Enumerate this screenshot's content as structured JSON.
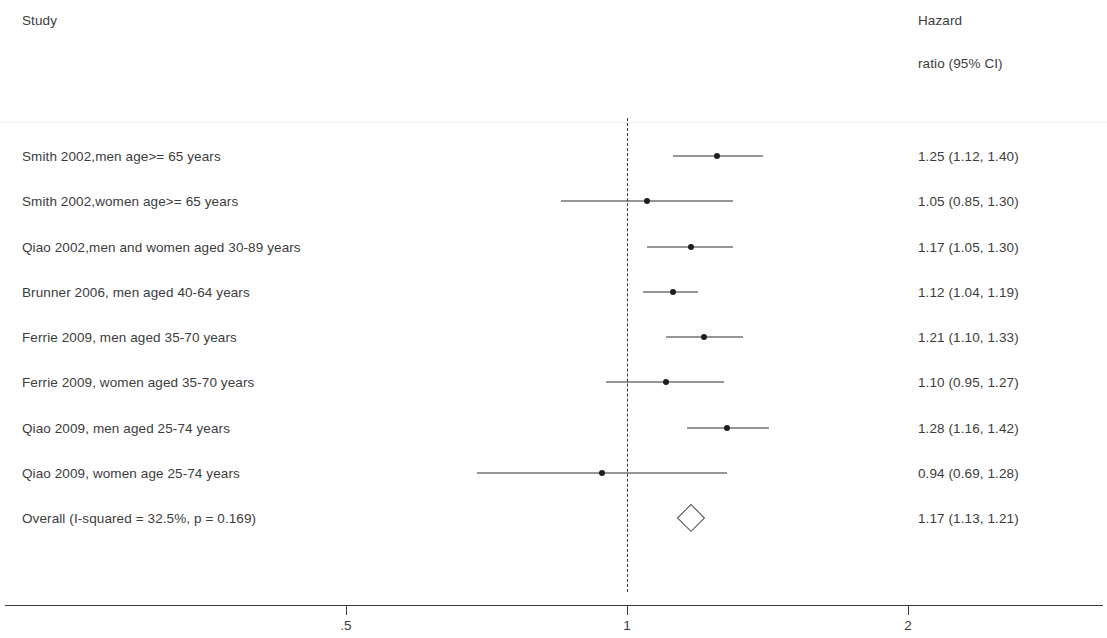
{
  "header": {
    "study_label": "Study",
    "effect_label_line1": "Hazard",
    "effect_label_line2": "ratio (95% CI)"
  },
  "chart_data": {
    "type": "forest",
    "title": "",
    "xlabel": "",
    "ylabel": "",
    "scale": "log",
    "null_value": 1,
    "xticks": [
      ".5",
      "1",
      "2"
    ],
    "xtick_values": [
      0.5,
      1,
      2
    ],
    "xlim": [
      0.5,
      2
    ],
    "grid": false,
    "legend": "none",
    "effect_measure": "Hazard ratio (95% CI)",
    "heterogeneity": "I-squared = 32.5%, p = 0.169",
    "categories": [
      "Smith 2002,men age>= 65 years",
      "Smith 2002,women age>= 65 years",
      "Qiao 2002,men and women aged 30-89 years",
      "Brunner 2006, men aged 40-64 years",
      "Ferrie 2009, men aged 35-70 years",
      "Ferrie 2009, women aged 35-70 years",
      "Qiao 2009, men aged 25-74 years",
      "Qiao 2009, women age 25-74 years",
      "Overall  (I-squared = 32.5%, p = 0.169)"
    ],
    "values": [
      1.25,
      1.05,
      1.17,
      1.12,
      1.21,
      1.1,
      1.28,
      0.94,
      1.17
    ],
    "ci_lower": [
      1.12,
      0.85,
      1.05,
      1.04,
      1.1,
      0.95,
      1.16,
      0.69,
      1.13
    ],
    "ci_upper": [
      1.4,
      1.3,
      1.3,
      1.19,
      1.33,
      1.27,
      1.42,
      1.28,
      1.21
    ],
    "rows": [
      {
        "label": "Smith 2002,men age>= 65 years",
        "estimate": 1.25,
        "lower": 1.12,
        "upper": 1.4,
        "text": "1.25 (1.12, 1.40)",
        "is_summary": false
      },
      {
        "label": "Smith 2002,women age>= 65 years",
        "estimate": 1.05,
        "lower": 0.85,
        "upper": 1.3,
        "text": "1.05 (0.85, 1.30)",
        "is_summary": false
      },
      {
        "label": "Qiao 2002,men and women aged 30-89 years",
        "estimate": 1.17,
        "lower": 1.05,
        "upper": 1.3,
        "text": "1.17 (1.05, 1.30)",
        "is_summary": false
      },
      {
        "label": "Brunner 2006, men aged 40-64 years",
        "estimate": 1.12,
        "lower": 1.04,
        "upper": 1.19,
        "text": "1.12 (1.04, 1.19)",
        "is_summary": false
      },
      {
        "label": "Ferrie 2009, men aged 35-70 years",
        "estimate": 1.21,
        "lower": 1.1,
        "upper": 1.33,
        "text": "1.21 (1.10, 1.33)",
        "is_summary": false
      },
      {
        "label": "Ferrie 2009, women aged 35-70 years",
        "estimate": 1.1,
        "lower": 0.95,
        "upper": 1.27,
        "text": "1.10 (0.95, 1.27)",
        "is_summary": false
      },
      {
        "label": "Qiao 2009, men aged 25-74 years",
        "estimate": 1.28,
        "lower": 1.16,
        "upper": 1.42,
        "text": "1.28 (1.16, 1.42)",
        "is_summary": false
      },
      {
        "label": "Qiao 2009, women age 25-74 years",
        "estimate": 0.94,
        "lower": 0.69,
        "upper": 1.28,
        "text": "0.94 (0.69, 1.28)",
        "is_summary": false
      },
      {
        "label": "Overall  (I-squared = 32.5%, p = 0.169)",
        "estimate": 1.17,
        "lower": 1.13,
        "upper": 1.21,
        "text": "1.17 (1.13, 1.21)",
        "is_summary": true
      }
    ]
  },
  "colors": {
    "text": "#3c3c3c",
    "line": "#2e2e2e",
    "marker": "#1f1f1f",
    "axis": "#3a3a3a",
    "rule": "#f1f1f1",
    "background": "#ffffff"
  }
}
